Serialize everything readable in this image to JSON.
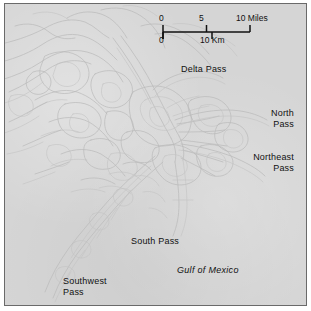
{
  "map": {
    "title": "Mississippi River Delta",
    "background_color": "#d5d5d5",
    "frame_color": "#6a6a6a",
    "line_color": "#bdbdbd",
    "text_color": "#111111",
    "labels": {
      "delta_pass": "Delta Pass",
      "north_pass": "North\nPass",
      "northeast_pass": "Northeast\nPass",
      "south_pass": "South Pass",
      "southwest_pass": "Southwest\nPass",
      "gulf_of_mexico": "Gulf of Mexico"
    }
  },
  "scale_bar": {
    "miles": {
      "zero": "0",
      "mid": "5",
      "max": "10 Miles"
    },
    "kilometers": {
      "zero": "0",
      "max": "10 Km"
    }
  }
}
